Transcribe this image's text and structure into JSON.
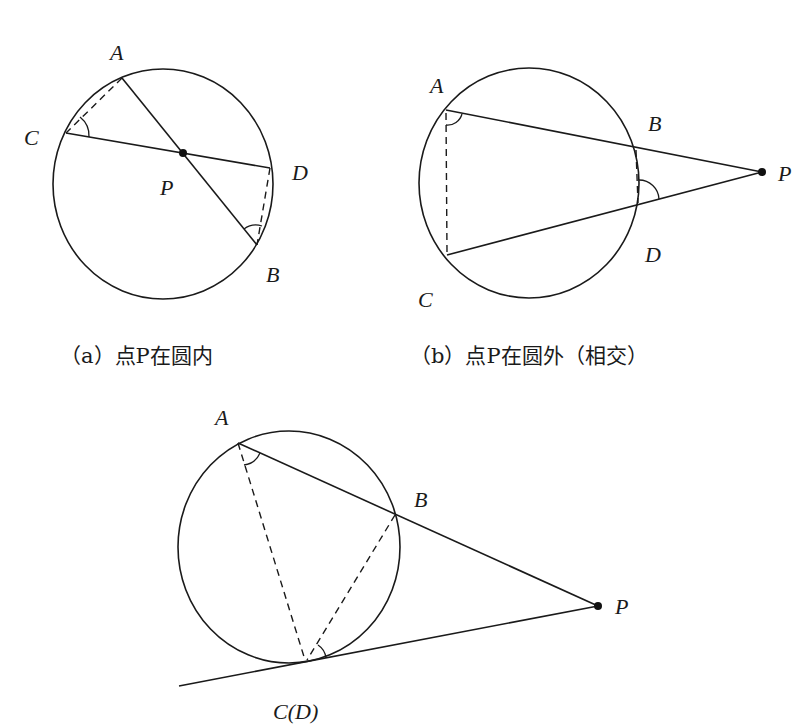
{
  "figures": [
    {
      "id": "a",
      "caption": "（a）点P在圆内",
      "caption_pos": [
        60,
        363
      ],
      "circle": {
        "cx": 163,
        "cy": 184,
        "rx": 110,
        "ry": 115
      },
      "points": {
        "A": {
          "x": 122,
          "y": 78,
          "label": "A",
          "lx": 110,
          "ly": 60
        },
        "B": {
          "x": 257,
          "y": 245,
          "label": "B",
          "lx": 266,
          "ly": 282
        },
        "C": {
          "x": 66,
          "y": 133,
          "label": "C",
          "lx": 24,
          "ly": 145
        },
        "D": {
          "x": 270,
          "y": 168,
          "label": "D",
          "lx": 292,
          "ly": 180
        },
        "P": {
          "x": 183,
          "y": 153,
          "label": "P",
          "lx": 160,
          "ly": 195
        }
      },
      "solid_segments": [
        [
          "A",
          "B"
        ],
        [
          "C",
          "D"
        ]
      ],
      "dashed_segments": [
        [
          "A",
          "C"
        ],
        [
          "D",
          "B"
        ]
      ],
      "angle_marks": [
        "C",
        "B"
      ]
    },
    {
      "id": "b",
      "caption": "（b）点P在圆外（相交）",
      "caption_pos": [
        470,
        363
      ],
      "circle": {
        "cx": 529,
        "cy": 183,
        "rx": 110,
        "ry": 115
      },
      "points": {
        "A": {
          "x": 446,
          "y": 110,
          "label": "A",
          "lx": 430,
          "ly": 93
        },
        "B": {
          "x": 636,
          "y": 148,
          "label": "B",
          "lx": 648,
          "ly": 131
        },
        "C": {
          "x": 447,
          "y": 255,
          "label": "C",
          "lx": 418,
          "ly": 307
        },
        "D": {
          "x": 638,
          "y": 205,
          "label": "D",
          "lx": 645,
          "ly": 262
        },
        "P": {
          "x": 762,
          "y": 172,
          "label": "P",
          "lx": 778,
          "ly": 181
        }
      },
      "solid_segments": [
        [
          "A",
          "P"
        ],
        [
          "C",
          "P"
        ]
      ],
      "dashed_segments": [
        [
          "A",
          "C"
        ],
        [
          "B",
          "D"
        ]
      ],
      "angle_marks": [
        "A",
        "D"
      ]
    },
    {
      "id": "c",
      "caption": "C(D)",
      "caption_pos": [
        273,
        719
      ],
      "circle": {
        "cx": 289,
        "cy": 547,
        "rx": 111,
        "ry": 116
      },
      "points": {
        "A": {
          "x": 238,
          "y": 443,
          "label": "A",
          "lx": 215,
          "ly": 425
        },
        "B": {
          "x": 395,
          "y": 515,
          "label": "B",
          "lx": 414,
          "ly": 507
        },
        "C": {
          "x": 307,
          "y": 662,
          "label": "",
          "lx": 0,
          "ly": 0
        },
        "P": {
          "x": 598,
          "y": 606,
          "label": "P",
          "lx": 615,
          "ly": 614
        },
        "T": {
          "x": 179,
          "y": 686,
          "label": "",
          "lx": 0,
          "ly": 0
        }
      },
      "solid_segments": [
        [
          "A",
          "P"
        ],
        [
          "T",
          "P"
        ]
      ],
      "dashed_segments": [
        [
          "A",
          "C"
        ],
        [
          "B",
          "C"
        ]
      ],
      "angle_marks": [
        "A",
        "C"
      ]
    }
  ],
  "colors": {
    "ink": "#1a1a1a",
    "background": "#ffffff"
  }
}
